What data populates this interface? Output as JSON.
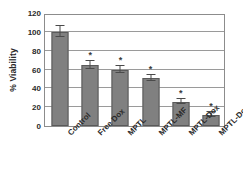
{
  "chart_data": {
    "type": "bar",
    "title": "",
    "xlabel": "",
    "ylabel": "% Viability",
    "ylim": [
      0,
      120
    ],
    "yticks": [
      0,
      20,
      40,
      60,
      80,
      100,
      120
    ],
    "grid": true,
    "legend": null,
    "categories": [
      "Control",
      "Free Dox",
      "MPTL",
      "MPTL-MF",
      "MPTL-Dox",
      "MPTL-Dox-MF"
    ],
    "values": [
      100,
      65,
      60,
      51,
      26,
      12
    ],
    "errors": [
      6,
      4,
      3.5,
      3,
      3,
      2.5
    ],
    "annotations": [
      "",
      "*",
      "*",
      "*",
      "*",
      "*"
    ],
    "significance_marker": "*",
    "bar_color": "#808080",
    "bar_edge_color": "#5a5a5a",
    "grid_color": "#9a9a9a",
    "frame_color": "#8c8c8c",
    "error_bar_color": "#4a4a4a"
  }
}
